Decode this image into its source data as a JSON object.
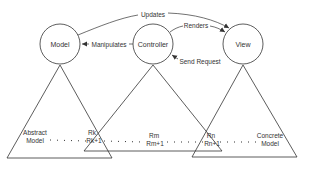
{
  "diagram": {
    "nodes": [
      {
        "id": "model",
        "label": "Model"
      },
      {
        "id": "controller",
        "label": "Controller"
      },
      {
        "id": "view",
        "label": "View"
      }
    ],
    "edges": [
      {
        "from": "controller",
        "to": "view",
        "label": "Updates",
        "via": "model"
      },
      {
        "from": "controller",
        "to": "view",
        "label": "Renders"
      },
      {
        "from": "controller",
        "to": "model",
        "label": "Manipulates"
      },
      {
        "from": "view",
        "to": "controller",
        "label": "Send Request"
      }
    ],
    "levels": {
      "left": {
        "line1": "Abstract",
        "line2": "Model"
      },
      "k": {
        "line1": "Rk",
        "line2": "Rk+1"
      },
      "m": {
        "line1": "Rm",
        "line2": "Rm+1"
      },
      "n": {
        "line1": "Rn",
        "line2": "Rn+1"
      },
      "right": {
        "line1": "Concrete",
        "line2": "Model"
      }
    },
    "colors": {
      "stroke": "#333333",
      "text": "#333333",
      "background": "#ffffff"
    }
  }
}
